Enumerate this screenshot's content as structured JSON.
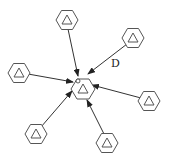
{
  "diagram": {
    "type": "star-network",
    "center_node": {
      "id": "center",
      "x": 83,
      "y": 89,
      "marker": "small-circle"
    },
    "nodes": [
      {
        "id": "n-top",
        "x": 67,
        "y": 20
      },
      {
        "id": "n-upper-right",
        "x": 133,
        "y": 38
      },
      {
        "id": "n-left",
        "x": 19,
        "y": 73
      },
      {
        "id": "n-right",
        "x": 149,
        "y": 101
      },
      {
        "id": "n-bottom-left",
        "x": 36,
        "y": 134
      },
      {
        "id": "n-bottom-right",
        "x": 107,
        "y": 143
      }
    ],
    "edges_into_center": 6,
    "edge_label": {
      "text": "D",
      "edge": "n-upper-right"
    },
    "colors": {
      "stroke": "#555555",
      "arrow": "#333333",
      "background": "#ffffff"
    }
  }
}
